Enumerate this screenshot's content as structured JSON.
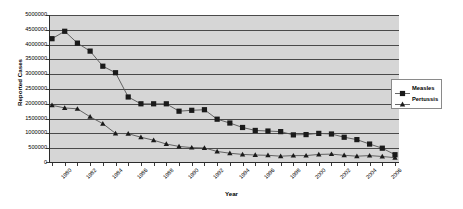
{
  "chart_data": {
    "type": "line",
    "title": "",
    "xlabel": "Year",
    "ylabel": "Reported Cases",
    "grid": true,
    "legend_position": "right",
    "ylim": [
      0,
      5000000
    ],
    "ytick_step": 500000,
    "ytick_labels": [
      "5000000",
      "4500000",
      "4000000",
      "3500000",
      "3000000",
      "2500000",
      "2000000",
      "1500000",
      "1000000",
      "500000",
      "0"
    ],
    "ytick_values": [
      5000000,
      4500000,
      4000000,
      3500000,
      3000000,
      2500000,
      2000000,
      1500000,
      1000000,
      500000,
      0
    ],
    "x": [
      1980,
      1981,
      1982,
      1983,
      1984,
      1985,
      1986,
      1987,
      1988,
      1989,
      1990,
      1991,
      1992,
      1993,
      1994,
      1995,
      1996,
      1997,
      1998,
      1999,
      2000,
      2001,
      2002,
      2003,
      2004,
      2005,
      2006,
      2007
    ],
    "xtick_labels": [
      "1980",
      "1982",
      "1984",
      "1986",
      "1988",
      "1990",
      "1992",
      "1994",
      "1996",
      "1998",
      "2000",
      "2002",
      "2004",
      "2006"
    ],
    "xtick_label_values": [
      1980,
      1982,
      1984,
      1986,
      1988,
      1990,
      1992,
      1994,
      1996,
      1998,
      2000,
      2002,
      2004,
      2006
    ],
    "series": [
      {
        "name": "Measles",
        "marker": "square",
        "color": "#1a1a1a",
        "values": [
          4200000,
          4450000,
          4050000,
          3780000,
          3270000,
          3050000,
          2230000,
          2000000,
          2000000,
          2000000,
          1750000,
          1780000,
          1800000,
          1480000,
          1350000,
          1200000,
          1100000,
          1080000,
          1060000,
          950000,
          960000,
          1000000,
          980000,
          870000,
          790000,
          640000,
          500000,
          280000
        ]
      },
      {
        "name": "Pertussis",
        "marker": "triangle",
        "color": "#1a1a1a",
        "values": [
          1950000,
          1860000,
          1830000,
          1560000,
          1330000,
          1000000,
          990000,
          870000,
          770000,
          640000,
          560000,
          520000,
          510000,
          390000,
          330000,
          290000,
          270000,
          260000,
          230000,
          250000,
          250000,
          290000,
          300000,
          260000,
          230000,
          250000,
          220000,
          180000
        ]
      }
    ]
  },
  "legend": {
    "entries": [
      {
        "label": "Measles",
        "marker": "square"
      },
      {
        "label": "Pertussis",
        "marker": "triangle"
      }
    ]
  }
}
